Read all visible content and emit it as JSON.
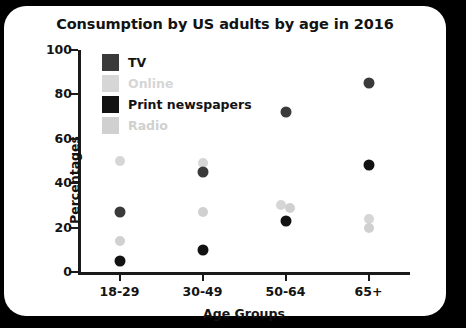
{
  "card": {
    "background": "#ffffff",
    "page_background": "#000000"
  },
  "chart_data": {
    "type": "scatter",
    "title": "Consumption by US adults by age in 2016",
    "xlabel": "Age Groups",
    "ylabel": "Percentages",
    "categories": [
      "18-29",
      "30-49",
      "50-64",
      "65+"
    ],
    "ylim": [
      0,
      100
    ],
    "yticks": [
      0,
      20,
      40,
      60,
      80,
      100
    ],
    "grid": false,
    "legend_position": "inside-top-left",
    "series": [
      {
        "name": "TV",
        "color": "#3a3a3a",
        "values": [
          27,
          45,
          72,
          85
        ]
      },
      {
        "name": "Online",
        "color": "#d6d6d6",
        "values": [
          50,
          49,
          30,
          24
        ]
      },
      {
        "name": "Print newspapers",
        "color": "#121212",
        "values": [
          5,
          10,
          23,
          48
        ]
      },
      {
        "name": "Radio",
        "color": "#d0d0d0",
        "values": [
          14,
          27,
          29,
          20
        ]
      }
    ]
  },
  "axis": {
    "ytick_labels": [
      "0",
      "20",
      "40",
      "60",
      "80",
      "100"
    ]
  }
}
